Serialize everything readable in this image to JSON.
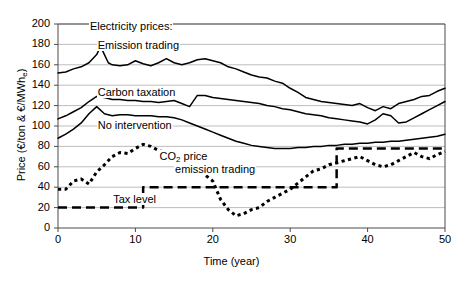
{
  "chart_data": {
    "type": "line",
    "title": "",
    "xlabel": "Time (year)",
    "ylabel": "Price (€/ton & €/MWh",
    "ylabel_sub": "e",
    "ylabel_tail": ")",
    "xlim": [
      0,
      50
    ],
    "ylim": [
      0,
      200
    ],
    "xticks": [
      0,
      10,
      20,
      30,
      40,
      50
    ],
    "yticks": [
      0,
      20,
      40,
      60,
      80,
      100,
      120,
      140,
      160,
      180,
      200
    ],
    "grid": "horizontal",
    "legend": "inline-annotations",
    "annotations": [
      {
        "text": "Electricity prices:",
        "x": 4,
        "y": 196
      },
      {
        "text": "Emission trading",
        "x": 5,
        "y": 177
      },
      {
        "text": "Carbon taxation",
        "x": 5,
        "y": 131
      },
      {
        "text": "No intervention",
        "x": 5,
        "y": 99
      },
      {
        "text": "CO2 price",
        "x": 13,
        "y": 69,
        "sub": "2"
      },
      {
        "text": "emission trading",
        "x": 15,
        "y": 56
      },
      {
        "text": "Tax level",
        "x": 7,
        "y": 26
      }
    ],
    "series": [
      {
        "name": "Emission trading",
        "style": "solid",
        "color": "#000000",
        "width": 1.5,
        "x": [
          0,
          1,
          2,
          3,
          4,
          5,
          5.5,
          6,
          6.5,
          7,
          8,
          9,
          10,
          11,
          12,
          13,
          14,
          15,
          16,
          17,
          18,
          19,
          20,
          21,
          22,
          23,
          24,
          25,
          26,
          27,
          28,
          29,
          30,
          31,
          32,
          33,
          34,
          35,
          36,
          37,
          38,
          39,
          40,
          41,
          42,
          43,
          44,
          45,
          46,
          47,
          48,
          49,
          50
        ],
        "values": [
          152,
          153,
          156,
          158,
          162,
          170,
          178,
          170,
          162,
          160,
          159,
          160,
          164,
          161,
          159,
          162,
          166,
          162,
          160,
          162,
          165,
          166,
          164,
          162,
          158,
          156,
          153,
          150,
          148,
          147,
          144,
          142,
          137,
          133,
          128,
          126,
          124,
          123,
          122,
          121,
          120,
          122,
          118,
          115,
          119,
          117,
          122,
          124,
          126,
          129,
          130,
          134,
          137
        ]
      },
      {
        "name": "Carbon taxation",
        "style": "solid",
        "color": "#000000",
        "width": 1.5,
        "x": [
          0,
          1,
          2,
          3,
          4,
          5,
          6,
          7,
          8,
          9,
          10,
          11,
          12,
          13,
          14,
          15,
          16,
          17,
          18,
          19,
          20,
          21,
          22,
          23,
          24,
          25,
          26,
          27,
          28,
          29,
          30,
          31,
          32,
          33,
          34,
          35,
          36,
          37,
          38,
          39,
          40,
          41,
          42,
          43,
          44,
          45,
          46,
          47,
          48,
          49,
          50
        ],
        "values": [
          107,
          110,
          114,
          118,
          124,
          129,
          128,
          126,
          126,
          125,
          125,
          124,
          124,
          123,
          124,
          125,
          122,
          119,
          130,
          130,
          128,
          127,
          126,
          125,
          124,
          123,
          122,
          120,
          119,
          117,
          116,
          114,
          112,
          111,
          110,
          108,
          107,
          106,
          105,
          104,
          102,
          106,
          112,
          110,
          103,
          104,
          108,
          112,
          116,
          120,
          124
        ]
      },
      {
        "name": "No intervention",
        "style": "solid",
        "color": "#000000",
        "width": 1.5,
        "x": [
          0,
          1,
          2,
          3,
          4,
          5,
          6,
          7,
          8,
          9,
          10,
          11,
          12,
          13,
          14,
          15,
          16,
          17,
          18,
          19,
          20,
          21,
          22,
          23,
          24,
          25,
          26,
          27,
          28,
          29,
          30,
          31,
          32,
          33,
          34,
          35,
          36,
          37,
          38,
          39,
          40,
          41,
          42,
          43,
          44,
          45,
          46,
          47,
          48,
          49,
          50
        ],
        "values": [
          88,
          92,
          97,
          103,
          112,
          119,
          112,
          110,
          111,
          111,
          110,
          110,
          110,
          109,
          109,
          108,
          106,
          103,
          100,
          97,
          94,
          91,
          88,
          85,
          83,
          81,
          80,
          79,
          78,
          78,
          78,
          79,
          79,
          80,
          80,
          81,
          81,
          82,
          82,
          83,
          83,
          84,
          84,
          85,
          85,
          86,
          87,
          88,
          89,
          90,
          92
        ]
      },
      {
        "name": "CO2 price emission trading",
        "style": "dotted",
        "color": "#000000",
        "width": 3,
        "x": [
          0,
          1,
          2,
          3,
          4,
          5,
          6,
          7,
          8,
          9,
          10,
          11,
          12,
          13,
          14,
          15,
          16,
          17,
          18,
          19,
          20,
          21,
          22,
          23,
          24,
          25,
          26,
          27,
          28,
          29,
          30,
          31,
          32,
          33,
          34,
          35,
          36,
          37,
          38,
          39,
          40,
          41,
          42,
          43,
          44,
          45,
          46,
          47,
          48,
          49,
          50
        ],
        "values": [
          38,
          38,
          46,
          48,
          43,
          55,
          62,
          70,
          74,
          73,
          78,
          82,
          80,
          76,
          74,
          72,
          68,
          62,
          57,
          52,
          46,
          28,
          18,
          12,
          14,
          18,
          20,
          26,
          30,
          34,
          38,
          44,
          50,
          56,
          58,
          62,
          64,
          66,
          68,
          70,
          66,
          62,
          60,
          62,
          66,
          70,
          74,
          70,
          68,
          72,
          75
        ]
      },
      {
        "name": "Tax level",
        "style": "dashed",
        "color": "#000000",
        "width": 2.5,
        "x": [
          0,
          11,
          11,
          36,
          36,
          50
        ],
        "values": [
          20,
          20,
          40,
          40,
          78,
          78
        ]
      }
    ]
  }
}
